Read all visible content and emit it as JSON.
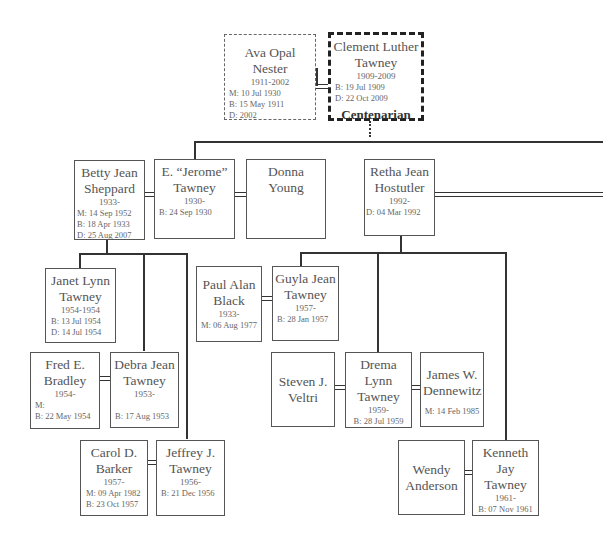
{
  "root_couple": {
    "spouse": {
      "name": "Ava Opal Nester",
      "years": "1911-2002",
      "details": [
        "M: 10 Jul 1930",
        "B: 15 May 1911",
        "D: 2002"
      ]
    },
    "person": {
      "name": "Clement Luther Tawney",
      "years": "1909-2009",
      "details": [
        "B: 19 Jul 1909",
        "D: 22 Oct 2009"
      ],
      "badge": "Centenarian"
    }
  },
  "generation2": {
    "jerome": {
      "name": "E. “Jerome” Tawney",
      "years": "1930-",
      "details": [
        "B: 24 Sep 1930"
      ]
    },
    "betty": {
      "name": "Betty Jean Sheppard",
      "years": "1933-",
      "details": [
        "M: 14 Sep 1952",
        "B: 18 Apr 1933",
        "D: 25 Aug 2007"
      ]
    },
    "donna": {
      "name": "Donna Young"
    },
    "retha": {
      "name": "Retha Jean Hostutler",
      "years": "1992-",
      "details": [
        "D: 04 Mar 1992"
      ]
    }
  },
  "betty_children": {
    "janet": {
      "name": "Janet Lynn Tawney",
      "years": "1954-1954",
      "details": [
        "B: 13 Jul 1954",
        "D: 14 Jul 1954"
      ]
    },
    "fred": {
      "name": "Fred E. Bradley",
      "years": "1954-",
      "details": [
        "M:",
        "B: 22 May 1954"
      ]
    },
    "debra": {
      "name": "Debra Jean Tawney",
      "years": "1953-",
      "details": [
        "B: 17 Aug 1953"
      ]
    },
    "carol": {
      "name": "Carol D. Barker",
      "years": "1957-",
      "details": [
        "M: 09 Apr 1982",
        "B: 23 Oct 1957"
      ]
    },
    "jeffrey": {
      "name": "Jeffrey J. Tawney",
      "years": "1956-",
      "details": [
        "B: 21 Dec 1956"
      ]
    }
  },
  "retha_children": {
    "paul": {
      "name": "Paul Alan Black",
      "years": "1933-",
      "details": [
        "M: 06 Aug 1977"
      ]
    },
    "guyla": {
      "name": "Guyla Jean Tawney",
      "years": "1957-",
      "details": [
        "B: 28 Jan 1957"
      ]
    },
    "steven": {
      "name": "Steven J. Veltri"
    },
    "drema": {
      "name": "Drema Lynn Tawney",
      "years": "1959-",
      "details": [
        "B: 28 Jul 1959"
      ]
    },
    "james": {
      "name": "James W. Dennewitz",
      "details": [
        "M: 14 Feb 1985"
      ]
    },
    "wendy": {
      "name": "Wendy Anderson"
    },
    "kenneth": {
      "name": "Kenneth Jay Tawney",
      "years": "1961-",
      "details": [
        "B: 07 Nov 1961"
      ]
    }
  }
}
